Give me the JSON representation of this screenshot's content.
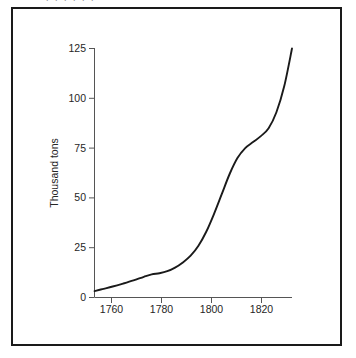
{
  "figure": {
    "scan_top_remnant": ". .  .   .    .     .",
    "border_color": "#1a1a1a",
    "background_color": "#ffffff"
  },
  "chart_data": {
    "type": "line",
    "title": "",
    "xlabel": "",
    "ylabel": "Thousand tons",
    "xlim": [
      1753,
      1829
    ],
    "ylim": [
      0,
      125
    ],
    "grid": false,
    "legend": "none",
    "line_color": "#1a1a1a",
    "x_ticks": [
      1760,
      1780,
      1800,
      1820
    ],
    "x_tick_labels": [
      "1760",
      "1780",
      "1800",
      "1820"
    ],
    "y_ticks": [
      0,
      25,
      50,
      75,
      100,
      125
    ],
    "y_tick_labels": [
      "0",
      "25",
      "50",
      "75",
      "100",
      "125"
    ],
    "series": [
      {
        "name": "Output",
        "x": [
          1753,
          1756,
          1760,
          1764,
          1768,
          1772,
          1775,
          1778,
          1781,
          1784,
          1787,
          1790,
          1793,
          1796,
          1799,
          1802,
          1805,
          1808,
          1811,
          1814,
          1817,
          1820,
          1823,
          1826,
          1829
        ],
        "values": [
          3.2,
          4.2,
          5.5,
          7.0,
          8.6,
          10.4,
          11.6,
          12.2,
          13.2,
          15.0,
          17.6,
          21.0,
          26.0,
          33.0,
          42.0,
          52.0,
          62.0,
          70.0,
          75.0,
          78.0,
          81.0,
          85.0,
          93.0,
          106.0,
          125.0
        ]
      }
    ]
  }
}
